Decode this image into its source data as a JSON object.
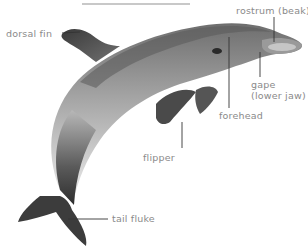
{
  "diagram": {
    "labels": {
      "dorsal_fin": "dorsal fin",
      "rostrum": "rostrum (beak)",
      "forehead": "forehead",
      "gape_line1": "gape",
      "gape_line2": "(lower jaw)",
      "flipper": "flipper",
      "tail_fluke": "tail fluke"
    },
    "colors": {
      "label_text": "#8a8a8a",
      "leader_line": "#333333",
      "body_dark": "#3a3a3a",
      "body_mid": "#8c8c8c",
      "body_light": "#e6e6e6"
    }
  }
}
